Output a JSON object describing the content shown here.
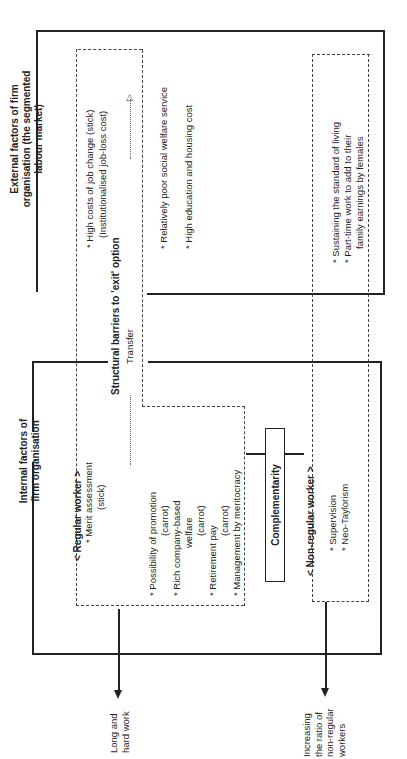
{
  "external": {
    "title_lines": [
      "External factors of firm",
      "organisation (the segmented",
      "labour market)"
    ],
    "items": [
      "* High costs of job change (stick)",
      "(Institutionalised job-loss cost)",
      "* Relatively poor social welfare service",
      "* High education and housing cost"
    ],
    "female_items": [
      "* Sustaining the standard of living",
      "* Part-time work to add to their",
      "family earnings by females"
    ]
  },
  "barrier": {
    "title": "Structural barriers to 'exit' option",
    "transfer_label": "Transfer"
  },
  "internal": {
    "title_lines": [
      "Internal factors of",
      "firm organisation"
    ],
    "regular": {
      "heading": "< Regular worker >",
      "items": [
        "* Merit assessment",
        "(stick)"
      ],
      "carrots": [
        "* Possibility of promotion",
        "(carrot)",
        "* Rich company-based",
        "welfare",
        "(carrot)",
        "* Retirement pay",
        "(carrot)",
        "* Management by meritocracy"
      ]
    },
    "complementarity": "Complementarity",
    "nonregular": {
      "heading": "< Non-regular worker >",
      "items": [
        "* Supervision",
        "* Neo-Taylorism"
      ]
    }
  },
  "outcomes": {
    "regular": [
      "Long and",
      "hard work"
    ],
    "nonregular": [
      "Increasing",
      "the ratio of",
      "non-regular",
      "workers"
    ]
  }
}
